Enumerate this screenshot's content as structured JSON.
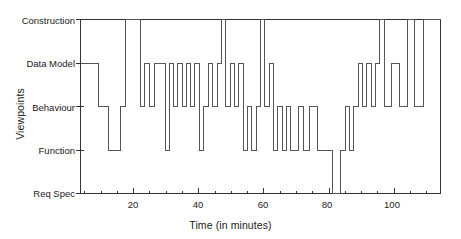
{
  "chart_data": {
    "type": "line",
    "subtype": "step-post",
    "title": "",
    "xlabel": "Time (in minutes)",
    "ylabel": "Viewpoints",
    "xlim": [
      3.7,
      114.2
    ],
    "ylim": [
      0,
      4
    ],
    "grid": false,
    "legend": null,
    "y_categories": [
      "Req Spec",
      "Function",
      "Behaviour",
      "Data Model",
      "Construction"
    ],
    "y_tick_labels": [
      "Construction",
      "Data Model",
      "Behaviour",
      "Function",
      "Req Spec"
    ],
    "y_tick_values": [
      4,
      3,
      2,
      1,
      0
    ],
    "x_tick_labels": [
      "20",
      "40",
      "60",
      "80",
      "100"
    ],
    "x_tick_values": [
      20,
      40,
      60,
      80,
      100
    ],
    "x_minor_step": 5,
    "line_color": "#555555",
    "axis_color": "#333333",
    "x": [
      3.7,
      9.3,
      12.2,
      16.0,
      17.4,
      22.2,
      23.4,
      25.0,
      26.4,
      29.7,
      30.9,
      32.2,
      33.5,
      34.9,
      36.2,
      37.5,
      38.8,
      40.2,
      41.4,
      43.0,
      44.3,
      45.7,
      47.0,
      48.2,
      49.6,
      51.0,
      52.3,
      53.6,
      55.0,
      56.3,
      57.6,
      58.9,
      60.2,
      61.6,
      62.9,
      64.2,
      65.6,
      67.0,
      68.3,
      70.6,
      72.3,
      74.0,
      76.3,
      81.0,
      83.5,
      85.0,
      86.3,
      87.6,
      89.0,
      90.3,
      91.6,
      93.0,
      94.3,
      95.6,
      97.0,
      99.3,
      101.6,
      104.0,
      106.3,
      109.0,
      114.2
    ],
    "y": [
      3,
      2,
      1,
      2,
      4,
      2,
      3,
      2,
      3,
      1,
      3,
      2,
      3,
      2,
      3,
      2,
      3,
      1,
      2,
      3,
      2,
      3,
      4,
      2,
      3,
      2,
      3,
      1,
      2,
      1,
      2,
      4,
      2,
      3,
      1,
      2,
      1,
      2,
      1,
      2,
      1,
      2,
      1,
      0,
      1,
      2,
      1,
      2,
      3,
      2,
      3,
      2,
      3,
      4,
      2,
      3,
      2,
      4,
      2,
      4,
      4
    ],
    "transitions": [
      {
        "time": 3.7,
        "viewpoint": "Data Model"
      },
      {
        "time": 9.3,
        "viewpoint": "Behaviour"
      },
      {
        "time": 12.2,
        "viewpoint": "Function"
      },
      {
        "time": 16.0,
        "viewpoint": "Behaviour"
      },
      {
        "time": 17.4,
        "viewpoint": "Construction"
      },
      {
        "time": 22.2,
        "viewpoint": "Behaviour"
      },
      {
        "time": 23.4,
        "viewpoint": "Data Model"
      },
      {
        "time": 25.0,
        "viewpoint": "Behaviour"
      },
      {
        "time": 26.4,
        "viewpoint": "Data Model"
      },
      {
        "time": 29.7,
        "viewpoint": "Function"
      },
      {
        "time": 30.9,
        "viewpoint": "Data Model"
      },
      {
        "time": 32.2,
        "viewpoint": "Behaviour"
      },
      {
        "time": 33.5,
        "viewpoint": "Data Model"
      },
      {
        "time": 34.9,
        "viewpoint": "Behaviour"
      },
      {
        "time": 36.2,
        "viewpoint": "Data Model"
      },
      {
        "time": 37.5,
        "viewpoint": "Behaviour"
      },
      {
        "time": 38.8,
        "viewpoint": "Data Model"
      },
      {
        "time": 40.2,
        "viewpoint": "Function"
      },
      {
        "time": 41.4,
        "viewpoint": "Behaviour"
      },
      {
        "time": 43.0,
        "viewpoint": "Data Model"
      },
      {
        "time": 44.3,
        "viewpoint": "Behaviour"
      },
      {
        "time": 45.7,
        "viewpoint": "Data Model"
      },
      {
        "time": 47.0,
        "viewpoint": "Construction"
      },
      {
        "time": 48.2,
        "viewpoint": "Behaviour"
      },
      {
        "time": 49.6,
        "viewpoint": "Data Model"
      },
      {
        "time": 51.0,
        "viewpoint": "Behaviour"
      },
      {
        "time": 52.3,
        "viewpoint": "Data Model"
      },
      {
        "time": 53.6,
        "viewpoint": "Function"
      },
      {
        "time": 55.0,
        "viewpoint": "Behaviour"
      },
      {
        "time": 56.3,
        "viewpoint": "Function"
      },
      {
        "time": 57.6,
        "viewpoint": "Behaviour"
      },
      {
        "time": 58.9,
        "viewpoint": "Construction"
      },
      {
        "time": 60.2,
        "viewpoint": "Behaviour"
      },
      {
        "time": 61.6,
        "viewpoint": "Data Model"
      },
      {
        "time": 62.9,
        "viewpoint": "Function"
      },
      {
        "time": 64.2,
        "viewpoint": "Behaviour"
      },
      {
        "time": 65.6,
        "viewpoint": "Function"
      },
      {
        "time": 67.0,
        "viewpoint": "Behaviour"
      },
      {
        "time": 68.3,
        "viewpoint": "Function"
      },
      {
        "time": 70.6,
        "viewpoint": "Behaviour"
      },
      {
        "time": 72.3,
        "viewpoint": "Function"
      },
      {
        "time": 74.0,
        "viewpoint": "Behaviour"
      },
      {
        "time": 76.3,
        "viewpoint": "Function"
      },
      {
        "time": 81.0,
        "viewpoint": "Req Spec"
      },
      {
        "time": 83.5,
        "viewpoint": "Function"
      },
      {
        "time": 85.0,
        "viewpoint": "Behaviour"
      },
      {
        "time": 86.3,
        "viewpoint": "Function"
      },
      {
        "time": 87.6,
        "viewpoint": "Behaviour"
      },
      {
        "time": 89.0,
        "viewpoint": "Data Model"
      },
      {
        "time": 90.3,
        "viewpoint": "Behaviour"
      },
      {
        "time": 91.6,
        "viewpoint": "Data Model"
      },
      {
        "time": 93.0,
        "viewpoint": "Behaviour"
      },
      {
        "time": 94.3,
        "viewpoint": "Data Model"
      },
      {
        "time": 95.6,
        "viewpoint": "Construction"
      },
      {
        "time": 97.0,
        "viewpoint": "Behaviour"
      },
      {
        "time": 99.3,
        "viewpoint": "Data Model"
      },
      {
        "time": 101.6,
        "viewpoint": "Behaviour"
      },
      {
        "time": 104.0,
        "viewpoint": "Construction"
      },
      {
        "time": 106.3,
        "viewpoint": "Behaviour"
      },
      {
        "time": 109.0,
        "viewpoint": "Construction"
      },
      {
        "time": 114.2,
        "viewpoint": "Construction"
      }
    ]
  }
}
